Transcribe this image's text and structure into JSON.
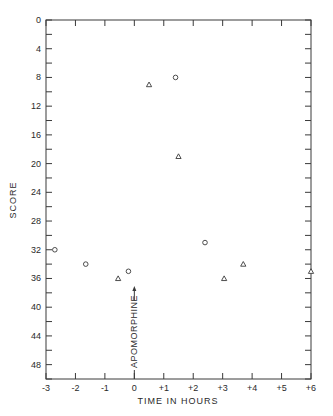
{
  "chart_data": {
    "type": "scatter",
    "title": "",
    "xlabel": "TIME IN HOURS",
    "ylabel": "SCORE",
    "xlim": [
      -3,
      6
    ],
    "ylim": [
      0,
      50
    ],
    "y_inverted": true,
    "grid": false,
    "x_ticks": [
      -3,
      -2,
      -1,
      0,
      1,
      2,
      3,
      4,
      5,
      6
    ],
    "x_tick_labels": [
      "-3",
      "-2",
      "-1",
      "0",
      "+1",
      "+2",
      "+3",
      "+4",
      "+5",
      "+6"
    ],
    "y_ticks": [
      0,
      4,
      8,
      12,
      16,
      20,
      24,
      28,
      32,
      36,
      40,
      44,
      48
    ],
    "y_tick_labels": [
      "0",
      "4",
      "8",
      "12",
      "16",
      "20",
      "24",
      "28",
      "32",
      "36",
      "40",
      "44",
      "48"
    ],
    "series": [
      {
        "name": "circles",
        "marker": "circle",
        "points": [
          {
            "x": -2.7,
            "y": 32
          },
          {
            "x": -1.65,
            "y": 34
          },
          {
            "x": -0.2,
            "y": 35
          },
          {
            "x": 1.4,
            "y": 8
          },
          {
            "x": 2.4,
            "y": 31
          }
        ]
      },
      {
        "name": "triangles",
        "marker": "triangle",
        "points": [
          {
            "x": -0.55,
            "y": 36
          },
          {
            "x": 0.5,
            "y": 9
          },
          {
            "x": 1.5,
            "y": 19
          },
          {
            "x": 3.05,
            "y": 36
          },
          {
            "x": 3.7,
            "y": 34
          },
          {
            "x": 6.0,
            "y": 35
          }
        ]
      }
    ],
    "annotations": [
      {
        "text": "APOMORPHINE",
        "x": 0,
        "arrow": "up",
        "rotation": -90
      }
    ]
  }
}
